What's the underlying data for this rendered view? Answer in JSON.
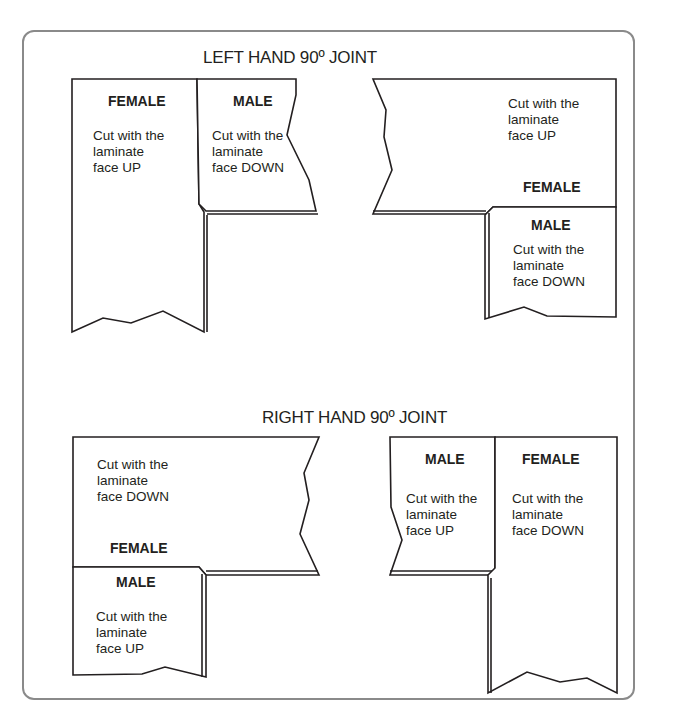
{
  "figure": {
    "frame_color": "#8a8a8a",
    "line_color": "#231f20",
    "sections": [
      {
        "title": "LEFT HAND 90º JOINT",
        "pieces": [
          {
            "role": "female",
            "label": "FEMALE",
            "note": "Cut with the\nlaminate\nface UP"
          },
          {
            "role": "male",
            "label": "MALE",
            "note": "Cut with the\nlaminate\nface DOWN"
          },
          {
            "role": "female",
            "label": "FEMALE",
            "note": "Cut with the\nlaminate\nface UP"
          },
          {
            "role": "male",
            "label": "MALE",
            "note": "Cut with the\nlaminate\nface DOWN"
          }
        ]
      },
      {
        "title": "RIGHT HAND 90º JOINT",
        "pieces": [
          {
            "role": "female",
            "label": "FEMALE",
            "note": "Cut with the\nlaminate\nface DOWN"
          },
          {
            "role": "male",
            "label": "MALE",
            "note": "Cut with the\nlaminate\nface UP"
          },
          {
            "role": "male",
            "label": "MALE",
            "note": "Cut with the\nlaminate\nface UP"
          },
          {
            "role": "female",
            "label": "FEMALE",
            "note": "Cut with the\nlaminate\nface DOWN"
          }
        ]
      }
    ]
  }
}
